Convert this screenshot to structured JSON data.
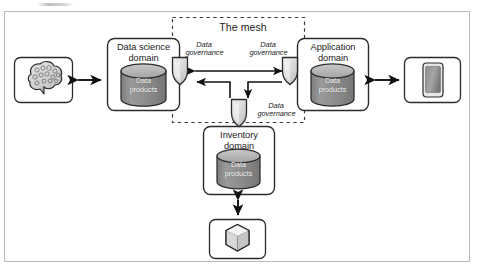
{
  "diagram": {
    "mesh_boundary_label": "The mesh",
    "colors": {
      "frame_border": "#b9b9b9",
      "box_stroke": "#2b2b2b",
      "cylinder_fill": "#8c8c8c",
      "cylinder_top": "#b4b4b4",
      "shield_fill": "#d9d9d9",
      "arrow": "#111111",
      "dash_stroke": "#3a3a3a",
      "text": "#1b1b1b",
      "data_products_text": "#ffffff"
    },
    "domains": [
      {
        "id": "data-science-domain",
        "title_line1": "Data science",
        "title_line2": "domain",
        "store_label_line1": "Data",
        "store_label_line2": "products",
        "store_icon": "cylinder-database-icon"
      },
      {
        "id": "application-domain",
        "title_line1": "Application",
        "title_line2": "domain",
        "store_label_line1": "Data",
        "store_label_line2": "products",
        "store_icon": "cylinder-database-icon"
      },
      {
        "id": "inventory-domain",
        "title_line1": "Inventory",
        "title_line2": "domain",
        "store_label_line1": "Data",
        "store_label_line2": "products",
        "store_icon": "cylinder-database-icon"
      }
    ],
    "governance_nodes": [
      {
        "id": "governance-left",
        "label_line1": "Data",
        "label_line2": "governance",
        "icon": "shield-icon"
      },
      {
        "id": "governance-right",
        "label_line1": "Data",
        "label_line2": "governance",
        "icon": "shield-icon"
      },
      {
        "id": "governance-bottom",
        "label_line1": "Data",
        "label_line2": "governance",
        "icon": "shield-icon"
      }
    ],
    "endpoints": [
      {
        "id": "consumer-brain",
        "icon": "brain-icon",
        "position": "left"
      },
      {
        "id": "consumer-mobile",
        "icon": "mobile-phone-icon",
        "position": "right"
      },
      {
        "id": "source-package",
        "icon": "package-cube-icon",
        "position": "bottom"
      }
    ],
    "connections": [
      {
        "from": "consumer-brain",
        "to": "data-science-domain",
        "style": "double-arrow"
      },
      {
        "from": "application-domain",
        "to": "consumer-mobile",
        "style": "double-arrow"
      },
      {
        "from": "governance-left",
        "to": "governance-right",
        "style": "double-arrow"
      },
      {
        "from": "governance-right",
        "to": "governance-bottom",
        "style": "arrow"
      },
      {
        "from": "governance-left",
        "to": "governance-bottom",
        "style": "arrow"
      },
      {
        "from": "inventory-domain",
        "to": "source-package",
        "style": "double-arrow"
      }
    ]
  }
}
